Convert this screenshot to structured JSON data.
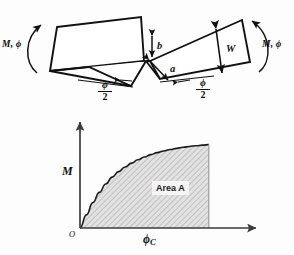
{
  "figure": {
    "title_text": "",
    "background_color": "#fdfdfd",
    "line_color": "#111111"
  },
  "top_diagram": {
    "name": "notched-plate-bending-diagram",
    "left_moment_label": "M, ϕ",
    "right_moment_label": "M, ϕ",
    "notch_depth_label": "b",
    "notch_flank_label": "a",
    "plate_width_label": "W",
    "left_angle_numerator": "ϕ",
    "left_angle_denominator": "2",
    "right_angle_numerator": "ϕ",
    "right_angle_denominator": "2"
  },
  "chart_data": {
    "type": "area",
    "title": "",
    "xlabel": "ϕ",
    "xlabel_sub": "C",
    "ylabel": "M",
    "origin_label": "O",
    "annotations": [
      {
        "text": "Area A",
        "x": 0.58,
        "y": 0.38
      }
    ],
    "grid": false,
    "legend": null,
    "xlim": [
      0,
      1.18
    ],
    "ylim": [
      0,
      1.18
    ],
    "fill_color": "#d0d0d0",
    "curve_color": "#1a1a1a",
    "axis_color": "#3b3b3b",
    "x": [
      0.0,
      0.05,
      0.1,
      0.15,
      0.2,
      0.25,
      0.3,
      0.35,
      0.4,
      0.45,
      0.5,
      0.55,
      0.6,
      0.65,
      0.7,
      0.75,
      0.8,
      0.85,
      0.9,
      0.95,
      1.0
    ],
    "y": [
      0.0,
      0.155,
      0.3,
      0.42,
      0.52,
      0.6,
      0.665,
      0.72,
      0.765,
      0.805,
      0.838,
      0.866,
      0.889,
      0.909,
      0.926,
      0.94,
      0.952,
      0.962,
      0.971,
      0.978,
      0.984
    ]
  }
}
